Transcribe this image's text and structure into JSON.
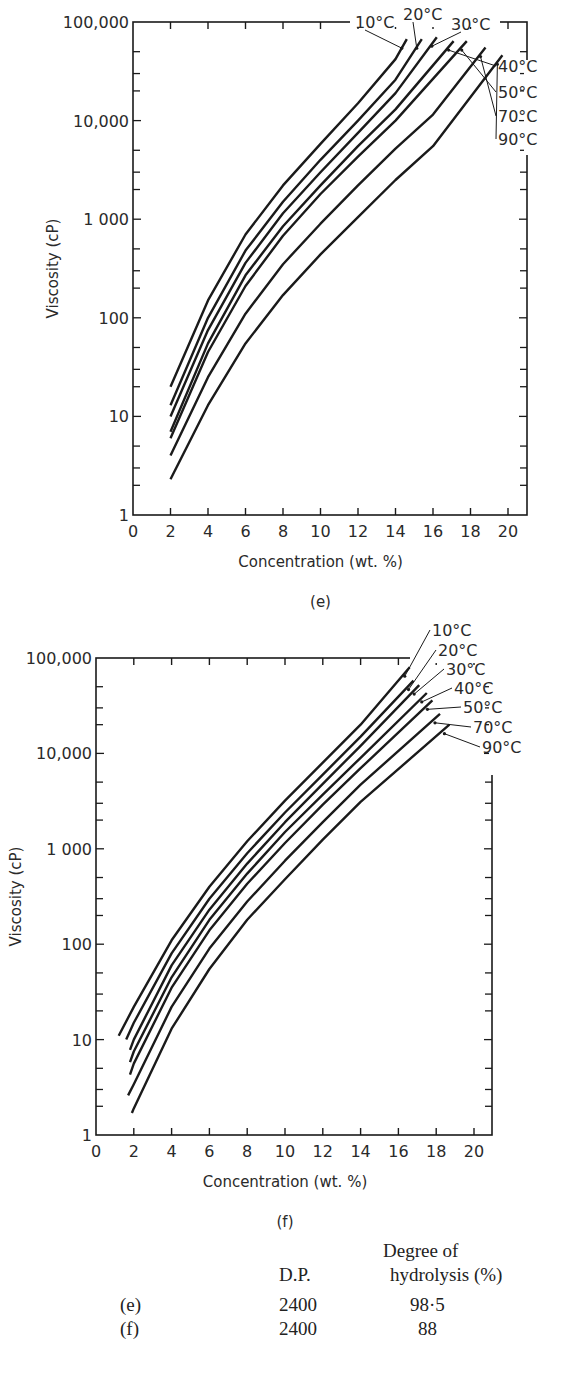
{
  "chart_data": [
    {
      "id": "e",
      "type": "line",
      "panel_label": "(e)",
      "title": "",
      "xlabel": "Concentration (wt. %)",
      "ylabel": "Viscosity (cP)",
      "xlim": [
        0,
        21
      ],
      "ylim": [
        1,
        100000
      ],
      "yscale": "log",
      "xticks": [
        0,
        2,
        4,
        6,
        8,
        10,
        12,
        14,
        16,
        18,
        20
      ],
      "xtick_labels": [
        "0",
        "2",
        "4",
        "6",
        "8",
        "10",
        "12",
        "14",
        "16",
        "18",
        "20"
      ],
      "yticks": [
        1,
        10,
        100,
        1000,
        10000,
        100000
      ],
      "ytick_labels": [
        "1",
        "10",
        "100",
        "1 000",
        "10,000",
        "100,000"
      ],
      "grid": false,
      "legend": "inline labels with arrows at curve ends (top right)",
      "series": [
        {
          "name": "10°C",
          "x": [
            2,
            4,
            6,
            8,
            10,
            12,
            14,
            14.6
          ],
          "y": [
            20,
            150,
            700,
            2200,
            5800,
            15000,
            42000,
            67000
          ]
        },
        {
          "name": "20°C",
          "x": [
            2,
            4,
            6,
            8,
            10,
            12,
            14,
            15.4
          ],
          "y": [
            13,
            100,
            480,
            1500,
            4000,
            10000,
            26000,
            67000
          ]
        },
        {
          "name": "30°C",
          "x": [
            2,
            4,
            6,
            8,
            10,
            12,
            14,
            16.2
          ],
          "y": [
            10,
            75,
            360,
            1150,
            3000,
            7500,
            19000,
            70000
          ]
        },
        {
          "name": "40°C",
          "x": [
            2,
            4,
            6,
            8,
            10,
            12,
            14,
            17.1
          ],
          "y": [
            7,
            55,
            270,
            850,
            2200,
            5500,
            13000,
            64000
          ]
        },
        {
          "name": "50°C",
          "x": [
            2,
            4,
            6,
            8,
            10,
            12,
            14,
            17.8
          ],
          "y": [
            6,
            45,
            210,
            680,
            1800,
            4300,
            10000,
            64000
          ]
        },
        {
          "name": "70°C",
          "x": [
            2,
            4,
            6,
            8,
            10,
            12,
            14,
            16,
            18.8
          ],
          "y": [
            4,
            25,
            110,
            350,
            900,
            2200,
            5200,
            11500,
            55000
          ]
        },
        {
          "name": "90°C",
          "x": [
            2,
            4,
            6,
            8,
            10,
            12,
            14,
            16,
            19.7
          ],
          "y": [
            2.3,
            13,
            55,
            170,
            440,
            1050,
            2500,
            5500,
            46000
          ]
        }
      ]
    },
    {
      "id": "f",
      "type": "line",
      "panel_label": "(f)",
      "title": "",
      "xlabel": "Concentration (wt. %)",
      "ylabel": "Viscosity (cP)",
      "xlim": [
        0,
        21
      ],
      "ylim": [
        1,
        100000
      ],
      "yscale": "log",
      "xticks": [
        0,
        2,
        4,
        6,
        8,
        10,
        12,
        14,
        16,
        18,
        20
      ],
      "xtick_labels": [
        "0",
        "2",
        "4",
        "6",
        "8",
        "10",
        "12",
        "14",
        "16",
        "18",
        "20"
      ],
      "yticks": [
        1,
        10,
        100,
        1000,
        10000,
        100000
      ],
      "ytick_labels": [
        "1",
        "10",
        "100",
        "1 000",
        "10,000",
        "100,000"
      ],
      "grid": false,
      "legend": "inline labels with arrows at curve ends (top right)",
      "series": [
        {
          "name": "10°C",
          "x": [
            1.2,
            2,
            4,
            6,
            8,
            10,
            12,
            14,
            16.6
          ],
          "y": [
            11,
            22,
            110,
            400,
            1200,
            3200,
            8000,
            20000,
            80000
          ]
        },
        {
          "name": "20°C",
          "x": [
            1.6,
            2,
            4,
            6,
            8,
            10,
            12,
            14,
            16.8
          ],
          "y": [
            10,
            15,
            80,
            300,
            900,
            2400,
            6000,
            15000,
            58000
          ]
        },
        {
          "name": "30°C",
          "x": [
            1.8,
            2,
            4,
            6,
            8,
            10,
            12,
            14,
            17.1
          ],
          "y": [
            7.8,
            10,
            60,
            230,
            700,
            1900,
            4800,
            12000,
            52000
          ]
        },
        {
          "name": "40°C",
          "x": [
            1.8,
            2,
            4,
            6,
            8,
            10,
            12,
            14,
            17.5
          ],
          "y": [
            5.8,
            7.5,
            45,
            180,
            550,
            1500,
            3700,
            9000,
            43000
          ]
        },
        {
          "name": "50°C",
          "x": [
            1.8,
            2,
            4,
            6,
            8,
            10,
            12,
            14,
            17.8
          ],
          "y": [
            4.3,
            5.6,
            35,
            140,
            430,
            1150,
            2900,
            7000,
            36000
          ]
        },
        {
          "name": "70°C",
          "x": [
            1.7,
            2,
            4,
            6,
            8,
            10,
            12,
            14,
            18.2
          ],
          "y": [
            2.6,
            3.4,
            22,
            90,
            280,
            750,
            1900,
            4700,
            26000
          ]
        },
        {
          "name": "90°C",
          "x": [
            1.9,
            2,
            4,
            6,
            8,
            10,
            12,
            14,
            18.7
          ],
          "y": [
            1.7,
            1.9,
            13,
            55,
            180,
            480,
            1250,
            3100,
            20000
          ]
        }
      ]
    }
  ],
  "table": {
    "headers": [
      "",
      "D.P.",
      "Degree of",
      "hydrolysis (%)"
    ],
    "rows": [
      {
        "label": "(e)",
        "dp": "2400",
        "hydrolysis": "98·5"
      },
      {
        "label": "(f)",
        "dp": "2400",
        "hydrolysis": "88"
      }
    ]
  },
  "layout": {
    "e": {
      "left": 133,
      "right": 527,
      "top": 22,
      "bottom": 515,
      "x0px": 133,
      "x20px": 508,
      "svg_top": 0
    },
    "f": {
      "left": 96,
      "right": 492,
      "top": 38,
      "bottom": 515,
      "x0px": 96,
      "x20px": 474,
      "svg_top": 620
    },
    "label_positions": {
      "e": [
        [
          355,
          28
        ],
        [
          403,
          20
        ],
        [
          451,
          30
        ],
        [
          498,
          72
        ],
        [
          498,
          98
        ],
        [
          498,
          122
        ],
        [
          498,
          145
        ]
      ],
      "f": [
        [
          432,
          16
        ],
        [
          438,
          36
        ],
        [
          446,
          55
        ],
        [
          454,
          74
        ],
        [
          463,
          93
        ],
        [
          473,
          113
        ],
        [
          482,
          133
        ]
      ]
    },
    "line_color": "#1a1a1a"
  }
}
